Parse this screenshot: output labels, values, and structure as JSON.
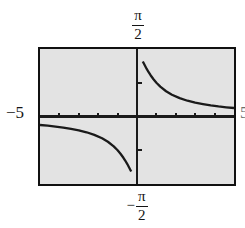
{
  "figure": {
    "title": "",
    "background_color": "#ffffff",
    "plot_fill_color": "#e3e3e3",
    "frame_color": "#111111",
    "curve_color": "#1a1a1a"
  },
  "labels": {
    "top": {
      "sign": "",
      "numerator": "π",
      "denominator": "2",
      "text": "π/2"
    },
    "bottom": {
      "sign": "−",
      "numerator": "π",
      "denominator": "2",
      "text": "−π/2"
    },
    "left": {
      "text": "−5"
    },
    "right": {
      "text": "5"
    }
  },
  "chart_data": {
    "type": "line",
    "title": "",
    "xlabel": "",
    "ylabel": "",
    "xlim": [
      -5,
      5
    ],
    "ylim": [
      -1.5707963,
      1.5707963
    ],
    "x_tick_labels": [
      "−5",
      "5"
    ],
    "y_tick_labels": [
      "−π/2",
      "π/2"
    ],
    "x_ticks": [
      -4,
      -3,
      -2,
      -1,
      1,
      2,
      3,
      4
    ],
    "y_ticks": [
      -0.7853982,
      0.7853982
    ],
    "grid": false,
    "legend": null,
    "axes_style": "graphing-calculator",
    "asymptote_x": 0,
    "series": [
      {
        "name": "branch-left",
        "comment": "lower-left branch, drops to -pi/2 as x approaches 0 from the left",
        "x": [
          -5.0,
          -4.6,
          -4.2,
          -3.8,
          -3.4,
          -3.0,
          -2.6,
          -2.2,
          -1.8,
          -1.5,
          -1.2,
          -1.0,
          -0.85,
          -0.7,
          -0.6,
          -0.5,
          -0.42,
          -0.36,
          -0.3
        ],
        "y": [
          -0.1974,
          -0.2145,
          -0.2349,
          -0.2595,
          -0.2897,
          -0.3217,
          -0.3672,
          -0.4266,
          -0.5071,
          -0.588,
          -0.6947,
          -0.7854,
          -0.8668,
          -0.9601,
          -1.0304,
          -1.1071,
          -1.1737,
          -1.2258,
          -1.2793
        ]
      },
      {
        "name": "branch-right",
        "comment": "upper-right branch, falls from +pi/2 toward 0 as x increases",
        "x": [
          0.3,
          0.36,
          0.42,
          0.5,
          0.6,
          0.7,
          0.85,
          1.0,
          1.2,
          1.5,
          1.8,
          2.2,
          2.6,
          3.0,
          3.4,
          3.8,
          4.2,
          4.6,
          5.0
        ],
        "y": [
          1.2793,
          1.2258,
          1.1737,
          1.1071,
          1.0304,
          0.9601,
          0.8668,
          0.7854,
          0.6947,
          0.588,
          0.5071,
          0.4266,
          0.3672,
          0.3217,
          0.2897,
          0.2595,
          0.2349,
          0.2145,
          0.1974
        ]
      }
    ]
  }
}
